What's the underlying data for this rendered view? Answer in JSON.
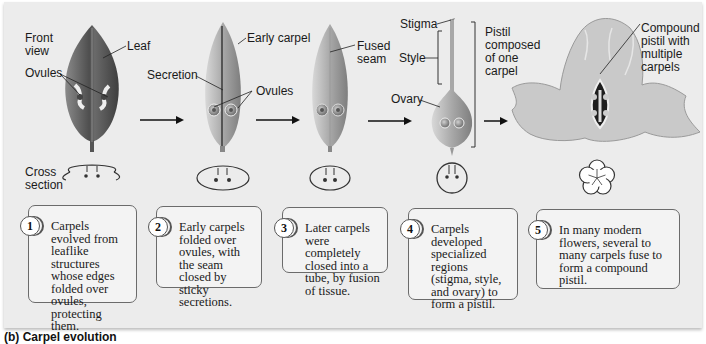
{
  "figure": {
    "caption": "(b) Carpel evolution",
    "labels": {
      "front_view": "Front\nview",
      "leaf": "Leaf",
      "ovules_1": "Ovules",
      "cross_section": "Cross\nsection",
      "early_carpel": "Early carpel",
      "secretion": "Secretion",
      "ovules_2": "Ovules",
      "fused_seam": "Fused\nseam",
      "stigma": "Stigma",
      "style": "Style",
      "ovary": "Ovary",
      "pistil_one_carpel": "Pistil\ncomposed\nof one\ncarpel",
      "compound_pistil": "Compound\npistil with\nmultiple\ncarpels"
    },
    "steps": [
      {
        "number": "1",
        "text": "Carpels evolved from leaflike structures whose edges folded over ovules, protecting them."
      },
      {
        "number": "2",
        "text": "Early carpels folded over ovules, with the seam closed by sticky secretions."
      },
      {
        "number": "3",
        "text": "Later carpels were completely closed into a tube, by fusion of tissue."
      },
      {
        "number": "4",
        "text": "Carpels developed specialized regions (stigma, style, and ovary) to form a pistil."
      },
      {
        "number": "5",
        "text": "In many modern flowers, several to many carpels fuse to form a compound pistil."
      }
    ],
    "colors": {
      "panel": "#ececec",
      "leaf_dark": "#5a5a5a",
      "carpel_light": "#b5b5b5",
      "line": "#333333"
    }
  }
}
